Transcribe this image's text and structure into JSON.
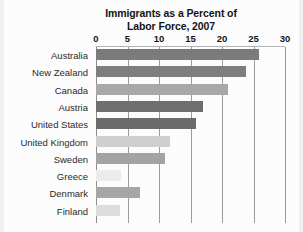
{
  "chart_data": {
    "type": "bar",
    "orientation": "horizontal",
    "title": "Immigrants as a Percent of Labor Force, 2007",
    "title_lines": [
      "Immigrants as a Percent of",
      "Labor Force, 2007"
    ],
    "xlabel": "",
    "ylabel": "",
    "xlim": [
      0,
      30
    ],
    "xticks": [
      0,
      5,
      10,
      15,
      20,
      25,
      30
    ],
    "xtick_labels": [
      "0",
      "5",
      "10",
      "15",
      "20",
      "25",
      "30"
    ],
    "grid": "vertical",
    "legend": "none",
    "categories": [
      "Australia",
      "New Zealand",
      "Canada",
      "Austria",
      "United States",
      "United Kingdom",
      "Sweden",
      "Greece",
      "Denmark",
      "Finland"
    ],
    "values": [
      25.9,
      23.8,
      21.0,
      17.0,
      15.9,
      11.8,
      11.0,
      4.0,
      7.0,
      3.8
    ],
    "bar_colors": [
      "#7b7b7b",
      "#7e7e7e",
      "#a8a8a8",
      "#6e6e6e",
      "#6b6b6b",
      "#cfcfcf",
      "#a3a3a3",
      "#ececec",
      "#a6a6a6",
      "#dcdcdc"
    ],
    "series": [
      {
        "name": "Immigrants as a percent of labor force",
        "values": [
          25.9,
          23.8,
          21.0,
          17.0,
          15.9,
          11.8,
          11.0,
          4.0,
          7.0,
          3.8
        ]
      }
    ]
  },
  "style": {
    "background": "#fcfcfc",
    "gridline_color": "#9a9a9a",
    "text_color": "#1a1a1a"
  }
}
